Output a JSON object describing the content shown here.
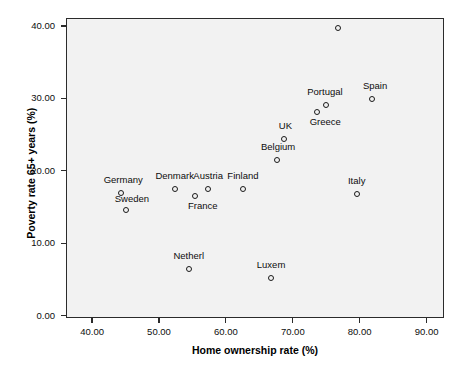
{
  "chart_data": {
    "type": "scatter",
    "title": "",
    "xlabel": "Home ownership rate (%)",
    "ylabel": "Poverty rate 65+ years (%)",
    "xlim": [
      36.1,
      92.6
    ],
    "ylim": [
      -0.3,
      41.1
    ],
    "xticks": [
      "40.00",
      "50.00",
      "60.00",
      "70.00",
      "80.00",
      "90.00"
    ],
    "xtick_values": [
      40,
      50,
      60,
      70,
      80,
      90
    ],
    "yticks": [
      "0.00",
      "10.00",
      "20.00",
      "30.00",
      "40.00"
    ],
    "ytick_values": [
      0,
      10,
      20,
      30,
      40
    ],
    "grid": false,
    "legend": "none",
    "marker": "open-circle",
    "panel_color": "#f2f2f2",
    "marker_color": "#1a1a1a",
    "points": [
      {
        "label": "Ireland",
        "x": 76.6,
        "y": 39.8,
        "lx": 0,
        "ly": -13
      },
      {
        "label": "Spain",
        "x": 81.7,
        "y": 30.0,
        "lx": 3,
        "ly": -13
      },
      {
        "label": "Portugal",
        "x": 74.8,
        "y": 29.3,
        "lx": -1,
        "ly": -13
      },
      {
        "label": "Greece",
        "x": 73.5,
        "y": 28.3,
        "lx": 8,
        "ly": 10
      },
      {
        "label": "UK",
        "x": 68.6,
        "y": 24.6,
        "lx": 1,
        "ly": -13
      },
      {
        "label": "Belgium",
        "x": 67.5,
        "y": 21.6,
        "lx": 1,
        "ly": -13
      },
      {
        "label": "Germany",
        "x": 44.2,
        "y": 17.1,
        "lx": 2,
        "ly": -13
      },
      {
        "label": "Sweden",
        "x": 44.9,
        "y": 14.8,
        "lx": 6,
        "ly": -11
      },
      {
        "label": "Denmark",
        "x": 52.2,
        "y": 17.6,
        "lx": 0,
        "ly": -13
      },
      {
        "label": "France",
        "x": 55.2,
        "y": 16.7,
        "lx": 8,
        "ly": 10
      },
      {
        "label": "Austria",
        "x": 57.2,
        "y": 17.6,
        "lx": 0,
        "ly": -13
      },
      {
        "label": "Finland",
        "x": 62.4,
        "y": 17.6,
        "lx": 0,
        "ly": -13
      },
      {
        "label": "Italy",
        "x": 79.4,
        "y": 17.0,
        "lx": 0,
        "ly": -13
      },
      {
        "label": "Netherl",
        "x": 54.3,
        "y": 6.6,
        "lx": 0,
        "ly": -13
      },
      {
        "label": "Luxem",
        "x": 66.6,
        "y": 5.3,
        "lx": 0,
        "ly": -13
      }
    ]
  }
}
